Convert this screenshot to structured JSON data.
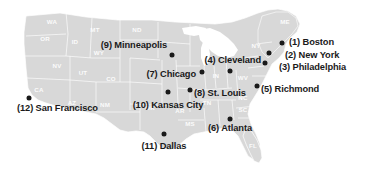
{
  "figure": {
    "name": "usa-city-map",
    "width": 366,
    "height": 171,
    "background_color": "#ffffff",
    "land_color": "#d8d8d8",
    "border_color": "#ffffff",
    "dot_color": "#1a1a1a",
    "label_color": "#1a1a1a"
  },
  "cities": [
    {
      "rank": "(1)",
      "name": "Boston",
      "label": "(1) Boston",
      "dot_x": 282,
      "dot_y": 43,
      "label_x": 289,
      "label_y": 43,
      "anchor": "lbl-right"
    },
    {
      "rank": "(2)",
      "name": "New York",
      "label": "(2) New York",
      "dot_x": 269,
      "dot_y": 53,
      "label_x": 285,
      "label_y": 56,
      "anchor": "lbl-right"
    },
    {
      "rank": "(3)",
      "name": "Philadelphia",
      "label": "(3) Philadelphia",
      "dot_x": 265,
      "dot_y": 63,
      "label_x": 279,
      "label_y": 68,
      "anchor": "lbl-right"
    },
    {
      "rank": "(4)",
      "name": "Cleveland",
      "label": "(4) Cleveland",
      "dot_x": 230,
      "dot_y": 71,
      "label_x": 261,
      "label_y": 61,
      "anchor": "lbl-left"
    },
    {
      "rank": "(5)",
      "name": "Richmond",
      "label": "(5) Richmond",
      "dot_x": 257,
      "dot_y": 86,
      "label_x": 261,
      "label_y": 90,
      "anchor": "lbl-right"
    },
    {
      "rank": "(6)",
      "name": "Atlanta",
      "label": "(6) Atlanta",
      "dot_x": 230,
      "dot_y": 119,
      "label_x": 230,
      "label_y": 124,
      "anchor": "lbl-below"
    },
    {
      "rank": "(7)",
      "name": "Chicago",
      "label": "(7) Chicago",
      "dot_x": 202,
      "dot_y": 72,
      "label_x": 196,
      "label_y": 75,
      "anchor": "lbl-left"
    },
    {
      "rank": "(8)",
      "name": "St. Louis",
      "label": "(8) St. Louis",
      "dot_x": 190,
      "dot_y": 90,
      "label_x": 194,
      "label_y": 94,
      "anchor": "lbl-right"
    },
    {
      "rank": "(9)",
      "name": "Minneapolis",
      "label": "(9) Minneapolis",
      "dot_x": 172,
      "dot_y": 55,
      "label_x": 167,
      "label_y": 46,
      "anchor": "lbl-left"
    },
    {
      "rank": "(10)",
      "name": "Kansas City",
      "label": "(10) Kansas City",
      "dot_x": 168,
      "dot_y": 92,
      "label_x": 168,
      "label_y": 101,
      "anchor": "lbl-below"
    },
    {
      "rank": "(11)",
      "name": "Dallas",
      "label": "(11) Dallas",
      "dot_x": 164,
      "dot_y": 134,
      "label_x": 164,
      "label_y": 142,
      "anchor": "lbl-below"
    },
    {
      "rank": "(12)",
      "name": "San Francisco",
      "label": "(12) San Francisco",
      "dot_x": 29,
      "dot_y": 98,
      "label_x": 17,
      "label_y": 109,
      "anchor": "lbl-right"
    }
  ],
  "state_labels": [
    {
      "abbr": "WA",
      "x": 52,
      "y": 24
    },
    {
      "abbr": "OR",
      "x": 45,
      "y": 41
    },
    {
      "abbr": "ID",
      "x": 75,
      "y": 44
    },
    {
      "abbr": "MT",
      "x": 95,
      "y": 32
    },
    {
      "abbr": "ND",
      "x": 137,
      "y": 32
    },
    {
      "abbr": "SD",
      "x": 138,
      "y": 48
    },
    {
      "abbr": "WY",
      "x": 99,
      "y": 55
    },
    {
      "abbr": "NV",
      "x": 57,
      "y": 68
    },
    {
      "abbr": "UT",
      "x": 83,
      "y": 75
    },
    {
      "abbr": "CO",
      "x": 111,
      "y": 81
    },
    {
      "abbr": "CA",
      "x": 39,
      "y": 92
    },
    {
      "abbr": "AZ",
      "x": 72,
      "y": 105
    },
    {
      "abbr": "NM",
      "x": 105,
      "y": 107
    },
    {
      "abbr": "OK",
      "x": 150,
      "y": 110
    },
    {
      "abbr": "AR",
      "x": 180,
      "y": 113
    },
    {
      "abbr": "TN",
      "x": 207,
      "y": 105
    },
    {
      "abbr": "IN",
      "x": 216,
      "y": 78
    },
    {
      "abbr": "WV",
      "x": 243,
      "y": 80
    },
    {
      "abbr": "NY",
      "x": 256,
      "y": 48
    },
    {
      "abbr": "ME",
      "x": 285,
      "y": 24
    },
    {
      "abbr": "NC",
      "x": 243,
      "y": 100
    },
    {
      "abbr": "SC",
      "x": 243,
      "y": 112
    },
    {
      "abbr": "MS",
      "x": 190,
      "y": 126
    },
    {
      "abbr": "FL",
      "x": 253,
      "y": 148
    }
  ]
}
